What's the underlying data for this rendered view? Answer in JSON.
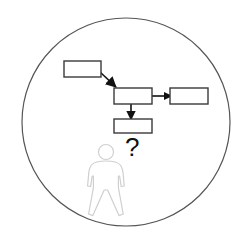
{
  "figure": {
    "background_color": "#ffffff",
    "boundary": {
      "shape": "circle",
      "name": "enclosing-circle",
      "center_x": 126,
      "center_y": 122,
      "radius": 104,
      "stroke_color": "#555555",
      "stroke_width": 1.2,
      "fill": "none"
    },
    "boxes": [
      {
        "id": "box-top-left",
        "label": "",
        "x": 64,
        "y": 61,
        "width": 37,
        "height": 16,
        "stroke_color": "#3a3a3a",
        "fill_color": "#ffffff",
        "stroke_width": 1.4
      },
      {
        "id": "box-middle",
        "label": "",
        "x": 114,
        "y": 88,
        "width": 38,
        "height": 16,
        "stroke_color": "#3a3a3a",
        "fill_color": "#ffffff",
        "stroke_width": 1.4
      },
      {
        "id": "box-right",
        "label": "",
        "x": 170,
        "y": 88,
        "width": 38,
        "height": 16,
        "stroke_color": "#3a3a3a",
        "fill_color": "#ffffff",
        "stroke_width": 1.4
      },
      {
        "id": "box-bottom",
        "label": "",
        "x": 114,
        "y": 119,
        "width": 38,
        "height": 14,
        "stroke_color": "#3a3a3a",
        "fill_color": "#ffffff",
        "stroke_width": 1.4
      }
    ],
    "arrows": [
      {
        "id": "arrow-diagonal",
        "from": "box-top-left",
        "to": "box-middle",
        "direction": "down-right",
        "x1": 101,
        "y1": 73,
        "x2": 117,
        "y2": 88,
        "color": "#111111"
      },
      {
        "id": "arrow-right",
        "from": "box-middle",
        "to": "box-right",
        "direction": "right",
        "x1": 152,
        "y1": 96,
        "x2": 170,
        "y2": 96,
        "color": "#111111"
      },
      {
        "id": "arrow-down",
        "from": "box-middle",
        "to": "box-bottom",
        "direction": "down",
        "x1": 131,
        "y1": 104,
        "x2": 131,
        "y2": 119,
        "color": "#111111"
      }
    ],
    "person": {
      "id": "person-figure",
      "stroke_color": "#cfcfcf",
      "fill_color": "#ffffff",
      "stroke_width": 1.2,
      "head_center_x": 106,
      "head_center_y": 152,
      "head_radius": 7.5,
      "body_top_y": 161,
      "body_bottom_y": 216
    },
    "question_mark": {
      "id": "question-mark",
      "text": "?",
      "x": 125,
      "y": 156,
      "font_size": 26,
      "color": "#111111"
    }
  }
}
